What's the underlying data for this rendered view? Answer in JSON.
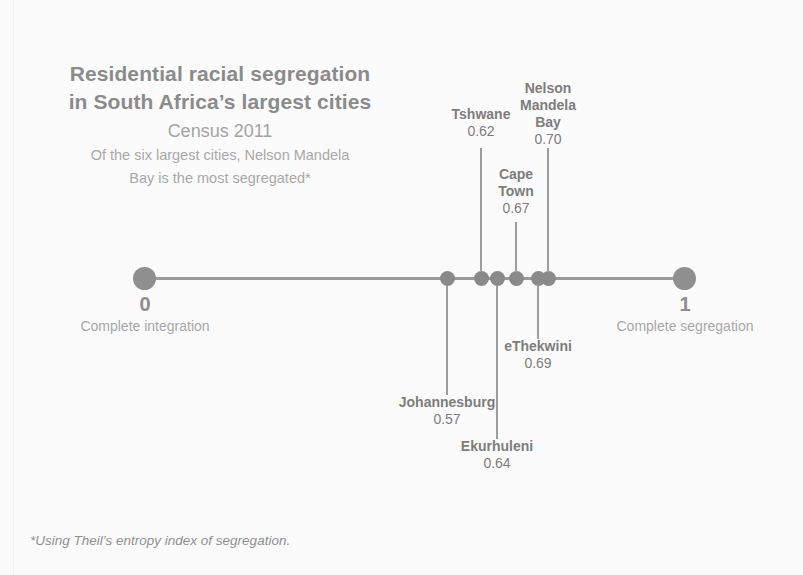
{
  "title": {
    "line1": "Residential racial segregation",
    "line2": "in South Africa’s largest cities",
    "subtitle": "Census 2011",
    "desc1": "Of the six largest cities, Nelson Mandela",
    "desc2": "Bay is the most segregated*"
  },
  "axis": {
    "left_value": "0",
    "left_caption": "Complete integration",
    "right_value": "1",
    "right_caption": "Complete segregation"
  },
  "footnote": "*Using Theil’s entropy index of segregation.",
  "colors": {
    "background": "#fbfbfb",
    "title": "#8b8b8b",
    "subtitle": "#a3a3a3",
    "axis": "#9a9a9a",
    "dot": "#8a8a8a",
    "label": "#7d7d7d"
  },
  "chart_data": {
    "type": "scatter",
    "title": "Residential racial segregation in South Africa’s largest cities",
    "subtitle": "Census 2011",
    "annotation": "Of the six largest cities, Nelson Mandela Bay is the most segregated*",
    "footnote": "*Using Theil’s entropy index of segregation.",
    "xlabel": "Theil’s entropy index of segregation",
    "ylabel": "",
    "xlim": [
      0,
      1
    ],
    "grid": false,
    "legend": "none",
    "axis_endpoint_labels": [
      {
        "value": "0",
        "caption": "Complete integration"
      },
      {
        "value": "1",
        "caption": "Complete segregation"
      }
    ],
    "categories": [
      "Johannesburg",
      "Tshwane",
      "Ekurhuleni",
      "Cape Town",
      "eThekwini",
      "Nelson Mandela Bay"
    ],
    "values": [
      0.57,
      0.62,
      0.64,
      0.67,
      0.69,
      0.7
    ],
    "points": [
      {
        "name": "Johannesburg",
        "value": "0.57",
        "label_lines": [
          "Johannesburg"
        ],
        "side": "below",
        "dot_x": 447,
        "leader_top": 286,
        "leader_height": 109,
        "label_left": 357,
        "label_top": 394,
        "label_width": 180
      },
      {
        "name": "Tshwane",
        "value": "0.62",
        "label_lines": [
          "Tshwane"
        ],
        "side": "above",
        "dot_x": 481,
        "leader_top": 148,
        "leader_height": 124,
        "label_left": 421,
        "label_top": 106,
        "label_width": 120
      },
      {
        "name": "Ekurhuleni",
        "value": "0.64",
        "label_lines": [
          "Ekurhuleni"
        ],
        "side": "below",
        "dot_x": 497,
        "leader_top": 286,
        "leader_height": 153,
        "label_left": 417,
        "label_top": 438,
        "label_width": 160
      },
      {
        "name": "Cape Town",
        "value": "0.67",
        "label_lines": [
          "Cape",
          "Town"
        ],
        "side": "above",
        "dot_x": 516,
        "leader_top": 222,
        "leader_height": 50,
        "label_left": 476,
        "label_top": 166,
        "label_width": 80
      },
      {
        "name": "eThekwini",
        "value": "0.69",
        "label_lines": [
          "eThekwini"
        ],
        "side": "below",
        "dot_x": 538,
        "leader_top": 286,
        "leader_height": 53,
        "label_left": 458,
        "label_top": 338,
        "label_width": 160
      },
      {
        "name": "Nelson Mandela Bay",
        "value": "0.70",
        "label_lines": [
          "Nelson",
          "Mandela",
          "Bay"
        ],
        "side": "above",
        "dot_x": 548,
        "leader_top": 148,
        "leader_height": 124,
        "label_left": 498,
        "label_top": 80,
        "label_width": 100
      }
    ]
  }
}
